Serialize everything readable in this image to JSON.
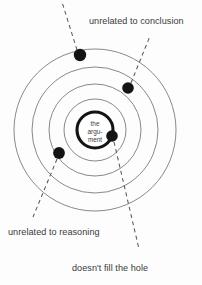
{
  "diagram": {
    "type": "concentric-target-diagram",
    "background_color": "#fdfdfd",
    "center": {
      "x": 95,
      "y": 130
    },
    "core": {
      "label_lines": [
        "the",
        "argu-",
        "ment"
      ],
      "radius": 18,
      "stroke_color": "#141414",
      "stroke_width": 3.1,
      "fill_color": "#ffffff"
    },
    "rings": [
      {
        "name": "ring-inner",
        "radius": 31,
        "stroke_color": "#6b6b6b"
      },
      {
        "name": "ring-second",
        "radius": 46,
        "stroke_color": "#6b6b6b"
      },
      {
        "name": "ring-third",
        "radius": 63,
        "stroke_color": "#6b6b6b"
      },
      {
        "name": "ring-outer",
        "radius": 81,
        "stroke_color": "#6b6b6b"
      }
    ],
    "dots": [
      {
        "name": "dot-top-outer",
        "x": 80,
        "y": 55,
        "r": 6.2,
        "color": "#141414"
      },
      {
        "name": "dot-upper-right",
        "x": 128,
        "y": 88,
        "r": 5.8,
        "color": "#141414"
      },
      {
        "name": "dot-lower-left",
        "x": 59,
        "y": 153,
        "r": 5.9,
        "color": "#141414"
      },
      {
        "name": "dot-on-core",
        "x": 112,
        "y": 136,
        "r": 5.8,
        "color": "#141414"
      }
    ],
    "leaders": [
      {
        "name": "leader-top",
        "x1": 77,
        "y1": 50,
        "x2": 62,
        "y2": 2
      },
      {
        "name": "leader-conclusion",
        "x1": 131,
        "y1": 83,
        "x2": 150,
        "y2": 36
      },
      {
        "name": "leader-reasoning",
        "x1": 57,
        "y1": 159,
        "x2": 33,
        "y2": 217
      },
      {
        "name": "leader-hole",
        "x1": 114,
        "y1": 142,
        "x2": 139,
        "y2": 249
      }
    ],
    "labels": {
      "conclusion": "unrelated to conclusion",
      "reasoning": "unrelated to reasoning",
      "hole": "doesn't fill the hole"
    },
    "label_positions": {
      "conclusion": {
        "x": 89,
        "y": 24
      },
      "reasoning": {
        "x": 8,
        "y": 235
      },
      "hole": {
        "x": 72,
        "y": 271
      }
    },
    "text_color": "#3a3a3a"
  }
}
